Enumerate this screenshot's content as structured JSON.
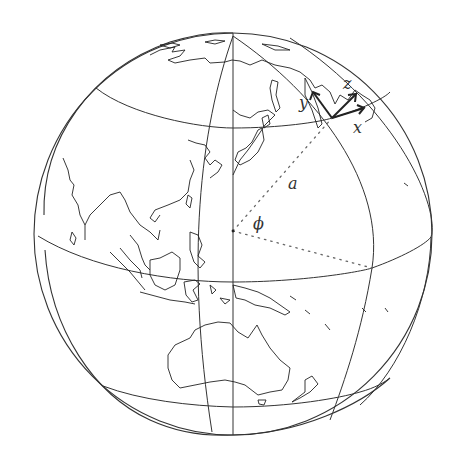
{
  "figure": {
    "type": "orthographic-globe-diagram",
    "region_shown": "East Asia / Western Pacific / Australia",
    "graticule": {
      "meridians": 3,
      "parallels": 3,
      "line_color": "#333333"
    },
    "local_frame": {
      "axes": [
        {
          "name": "x",
          "label": "x"
        },
        {
          "name": "y",
          "label": "y"
        },
        {
          "name": "z",
          "label": "z"
        }
      ]
    },
    "annotations": {
      "radius_label": "a",
      "latitude_angle_label": "ϕ"
    },
    "colors": {
      "background": "#ffffff",
      "lines": "#333333",
      "dotted": "#666666"
    }
  }
}
